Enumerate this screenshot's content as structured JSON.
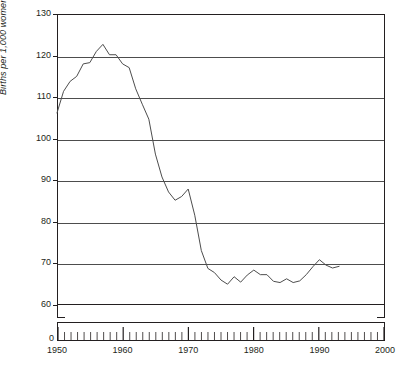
{
  "chart_data": {
    "type": "line",
    "title": "",
    "xlabel": "",
    "ylabel": "Births per 1,000 women aged 15–44",
    "xlim": [
      1950,
      2000
    ],
    "ylim": [
      60,
      130
    ],
    "y_axis_broken_to_zero": true,
    "y_zero_label": "0",
    "ytick_labels": [
      "130",
      "120",
      "110",
      "100",
      "90",
      "80",
      "70",
      "60"
    ],
    "ytick_values": [
      130,
      120,
      110,
      100,
      90,
      80,
      70,
      60
    ],
    "xtick_labels": [
      "1950",
      "1960",
      "1970",
      "1980",
      "1990",
      "2000"
    ],
    "xtick_values": [
      1950,
      1960,
      1970,
      1980,
      1990,
      2000
    ],
    "xtick_minor_interval": 1,
    "grid": "horizontal",
    "legend": null,
    "line_color": "#4d4d4d",
    "series": [
      {
        "name": "Births per 1,000 women aged 15-44",
        "x": [
          1950,
          1951,
          1952,
          1953,
          1954,
          1955,
          1956,
          1957,
          1958,
          1959,
          1960,
          1961,
          1962,
          1963,
          1964,
          1965,
          1966,
          1967,
          1968,
          1969,
          1970,
          1971,
          1972,
          1973,
          1974,
          1975,
          1976,
          1977,
          1978,
          1979,
          1980,
          1981,
          1982,
          1983,
          1984,
          1985,
          1986,
          1987,
          1988,
          1989,
          1990,
          1991,
          1992,
          1993
        ],
        "values": [
          106.2,
          111.4,
          113.8,
          115.0,
          118.0,
          118.3,
          121.0,
          122.7,
          120.2,
          120.2,
          118.0,
          117.1,
          112.0,
          108.3,
          104.7,
          96.3,
          90.8,
          87.2,
          85.2,
          86.1,
          87.9,
          81.6,
          73.1,
          68.8,
          67.8,
          66.0,
          65.0,
          66.8,
          65.5,
          67.2,
          68.4,
          67.3,
          67.3,
          65.7,
          65.4,
          66.3,
          65.4,
          65.8,
          67.3,
          69.2,
          70.9,
          69.6,
          68.9,
          69.3
        ]
      }
    ]
  },
  "axis": {
    "y_title": "Births per 1,000 women aged 15–44"
  }
}
